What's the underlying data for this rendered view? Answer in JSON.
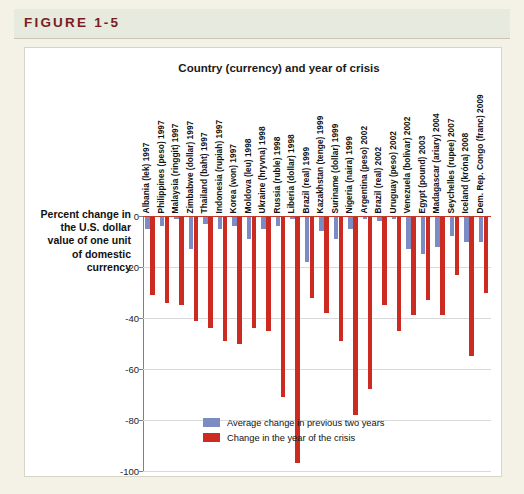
{
  "figure": {
    "tag": "FIGURE 1-5"
  },
  "axis_label": "Percent change in the U.S. dollar value of one unit of domestic currency",
  "legend": {
    "items": [
      {
        "label": "Average change in previous two years",
        "color": "#7b8cc4",
        "swatch_name": "legend-swatch-blue"
      },
      {
        "label": "Change in the year of the crisis",
        "color": "#cc2b22",
        "swatch_name": "legend-swatch-red"
      }
    ]
  },
  "chart_data": {
    "type": "bar",
    "title": "Country (currency) and year of crisis",
    "xlabel": "Country (currency) and year of crisis",
    "ylabel": "Percent change in the U.S. dollar value of one unit of domestic currency",
    "ylim": [
      -100,
      0
    ],
    "yticks": [
      0,
      -20,
      -40,
      -60,
      -80,
      -100
    ],
    "ytick_labels": [
      "0",
      "-20",
      "-40",
      "-60",
      "-80",
      "-100"
    ],
    "grid": true,
    "legend_position": "bottom-right-inside",
    "categories": [
      "Albania (lek) 1997",
      "Philippines (peso) 1997",
      "Malaysia (ringgit) 1997",
      "Zimbabwe (dollar) 1997",
      "Thailand (baht) 1997",
      "Indonesia (rupiah) 1997",
      "Korea (won) 1997",
      "Moldova (leu) 1998",
      "Ukraine (hryvna) 1998",
      "Russia (ruble) 1998",
      "Liberia (dollar) 1998",
      "Brazil (real) 1999",
      "Kazakhstan (tenge) 1999",
      "Suriname (dollar) 1999",
      "Nigeria (naira) 1999",
      "Argentina (peso) 2002",
      "Brazil (real) 2002",
      "Uruguay (peso) 2002",
      "Venezuela (bolivar) 2002",
      "Egypt (pound) 2003",
      "Madagascar (ariary) 2004",
      "Seychelles (rupee) 2007",
      "Iceland (króna) 2008",
      "Dem. Rep. Congo (franc) 2009"
    ],
    "series": [
      {
        "name": "Average change in previous two years",
        "color": "#7b8cc4",
        "values": [
          -5,
          -4,
          -1,
          -13,
          -3,
          -5,
          -4,
          -9,
          -5,
          -4,
          -1,
          -18,
          -6,
          -9,
          -5,
          -1,
          -2,
          -1,
          -13,
          -15,
          -12,
          -8,
          -10,
          -10
        ]
      },
      {
        "name": "Change in the year of the crisis",
        "color": "#cc2b22",
        "values": [
          -31,
          -34,
          -35,
          -41,
          -44,
          -49,
          -50,
          -44,
          -45,
          -71,
          -97,
          -32,
          -38,
          -49,
          -78,
          -68,
          -35,
          -45,
          -39,
          -33,
          -39,
          -23,
          -55,
          -30
        ]
      }
    ]
  }
}
